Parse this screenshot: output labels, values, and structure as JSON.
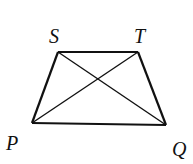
{
  "diagram": {
    "type": "trapezoid-with-diagonals",
    "vertices": {
      "S": {
        "label": "S",
        "x": 58,
        "y": 52
      },
      "T": {
        "label": "T",
        "x": 138,
        "y": 52
      },
      "P": {
        "label": "P",
        "x": 32,
        "y": 123
      },
      "Q": {
        "label": "Q",
        "x": 166,
        "y": 125
      }
    },
    "labels": {
      "S": "S",
      "T": "T",
      "P": "P",
      "Q": "Q"
    },
    "segments": [
      [
        "S",
        "T"
      ],
      [
        "T",
        "Q"
      ],
      [
        "Q",
        "P"
      ],
      [
        "P",
        "S"
      ],
      [
        "S",
        "Q"
      ],
      [
        "P",
        "T"
      ]
    ],
    "stroke_color": "#111111"
  }
}
